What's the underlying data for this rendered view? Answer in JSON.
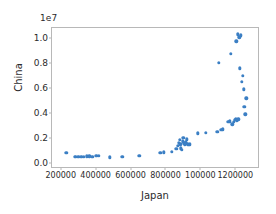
{
  "chart_data": {
    "type": "scatter",
    "title": "",
    "xlabel": "Japan",
    "ylabel": "China",
    "y_offset_text": "1e7",
    "y_offset_multiplier": 10000000,
    "grid": false,
    "legend": null,
    "marker_color": "#3b7fc4",
    "xlim": [
      150000,
      1330000
    ],
    "ylim": [
      -0.03,
      1.08
    ],
    "xticks": [
      200000,
      400000,
      600000,
      800000,
      1000000,
      1200000
    ],
    "xtick_labels": [
      "200000",
      "400000",
      "600000",
      "800000",
      "100000",
      "1200000"
    ],
    "yticks": [
      0.0,
      0.2,
      0.4,
      0.6,
      0.8,
      1.0
    ],
    "ytick_labels": [
      "0.0",
      "0.2",
      "0.4",
      "0.6",
      "0.8",
      "1.0"
    ],
    "points": [
      {
        "x": 233000,
        "y": 0.085
      },
      {
        "x": 280000,
        "y": 0.052
      },
      {
        "x": 287000,
        "y": 0.05
      },
      {
        "x": 300000,
        "y": 0.049
      },
      {
        "x": 317000,
        "y": 0.049
      },
      {
        "x": 333000,
        "y": 0.05
      },
      {
        "x": 350000,
        "y": 0.055
      },
      {
        "x": 364000,
        "y": 0.056
      },
      {
        "x": 380000,
        "y": 0.052
      },
      {
        "x": 404000,
        "y": 0.058
      },
      {
        "x": 417000,
        "y": 0.058
      },
      {
        "x": 480000,
        "y": 0.048
      },
      {
        "x": 553000,
        "y": 0.053
      },
      {
        "x": 650000,
        "y": 0.058
      },
      {
        "x": 770000,
        "y": 0.083
      },
      {
        "x": 790000,
        "y": 0.086
      },
      {
        "x": 838000,
        "y": 0.093
      },
      {
        "x": 862000,
        "y": 0.115
      },
      {
        "x": 872000,
        "y": 0.14
      },
      {
        "x": 878000,
        "y": 0.165
      },
      {
        "x": 881000,
        "y": 0.186
      },
      {
        "x": 884000,
        "y": 0.15
      },
      {
        "x": 888000,
        "y": 0.12
      },
      {
        "x": 893000,
        "y": 0.105
      },
      {
        "x": 900000,
        "y": 0.175
      },
      {
        "x": 903000,
        "y": 0.205
      },
      {
        "x": 907000,
        "y": 0.16
      },
      {
        "x": 911000,
        "y": 0.148
      },
      {
        "x": 915000,
        "y": 0.168
      },
      {
        "x": 919000,
        "y": 0.155
      },
      {
        "x": 923000,
        "y": 0.192
      },
      {
        "x": 928000,
        "y": 0.152
      },
      {
        "x": 933000,
        "y": 0.148
      },
      {
        "x": 940000,
        "y": 0.15
      },
      {
        "x": 985000,
        "y": 0.24
      },
      {
        "x": 1030000,
        "y": 0.243
      },
      {
        "x": 1098000,
        "y": 0.25
      },
      {
        "x": 1105000,
        "y": 0.8
      },
      {
        "x": 1120000,
        "y": 0.268
      },
      {
        "x": 1130000,
        "y": 0.272
      },
      {
        "x": 1160000,
        "y": 0.33
      },
      {
        "x": 1168000,
        "y": 0.335
      },
      {
        "x": 1175000,
        "y": 0.872
      },
      {
        "x": 1182000,
        "y": 0.31
      },
      {
        "x": 1190000,
        "y": 0.33
      },
      {
        "x": 1196000,
        "y": 0.345
      },
      {
        "x": 1202000,
        "y": 0.35
      },
      {
        "x": 1205000,
        "y": 0.975
      },
      {
        "x": 1208000,
        "y": 0.34
      },
      {
        "x": 1212000,
        "y": 0.345
      },
      {
        "x": 1215000,
        "y": 1.03
      },
      {
        "x": 1218000,
        "y": 0.352
      },
      {
        "x": 1222000,
        "y": 1.005
      },
      {
        "x": 1225000,
        "y": 0.758
      },
      {
        "x": 1232000,
        "y": 1.022
      },
      {
        "x": 1238000,
        "y": 0.648
      },
      {
        "x": 1242000,
        "y": 0.7
      },
      {
        "x": 1248000,
        "y": 0.592
      },
      {
        "x": 1252000,
        "y": 0.452
      },
      {
        "x": 1258000,
        "y": 0.39
      },
      {
        "x": 1262000,
        "y": 0.52
      }
    ]
  }
}
